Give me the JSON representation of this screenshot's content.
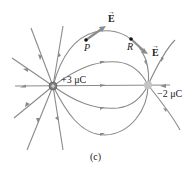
{
  "diagram": {
    "caption": "(c)",
    "charges": [
      {
        "label": "+3 μC",
        "sign": "positive",
        "color": "#7a7a7a"
      },
      {
        "label": "−2 μC",
        "sign": "negative",
        "color": "#b8b8b8"
      }
    ],
    "points": [
      {
        "label": "P"
      },
      {
        "label": "R"
      }
    ],
    "field_vectors": [
      {
        "label": "E",
        "at": "P"
      },
      {
        "label": "E",
        "at": "R"
      }
    ],
    "colors": {
      "field_line": "#8a8a8a",
      "e_vector": "#8c8c8c",
      "text": "#222222"
    }
  }
}
